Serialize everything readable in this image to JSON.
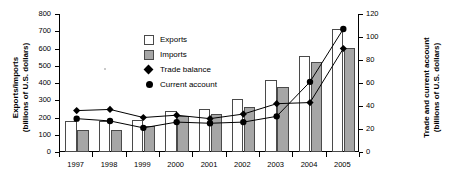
{
  "chart_data": {
    "type": "bar",
    "title": "",
    "categories": [
      "1997",
      "1998",
      "1999",
      "2000",
      "2001",
      "2002",
      "2003",
      "2004",
      "2005"
    ],
    "xlabel": "",
    "ylabel": "Exports/imports (billions of U.S. dollars)",
    "ylabel_right": "Trade and current account (billions of U.S. dollars)",
    "ylim": [
      0,
      800
    ],
    "ylim_right": [
      0,
      120
    ],
    "ytick_values": [
      0,
      100,
      200,
      300,
      400,
      500,
      600,
      700,
      800
    ],
    "ytick_labels": [
      "0",
      "100",
      "200",
      "300",
      "400",
      "500",
      "600",
      "700",
      "800"
    ],
    "ytick_values_right": [
      0,
      20,
      40,
      60,
      80,
      100,
      120
    ],
    "ytick_labels_right": [
      "0",
      "20",
      "40",
      "60",
      "80",
      "100",
      "120"
    ],
    "grid": false,
    "legend_position": "upper-left-inside",
    "series": [
      {
        "name": "Exports",
        "type": "bar",
        "axis": "left",
        "color": "#ffffff",
        "edge_color": "#4a4a4a",
        "values": [
          180,
          178,
          188,
          236,
          247,
          305,
          415,
          555,
          715
        ]
      },
      {
        "name": "Imports",
        "type": "bar",
        "axis": "left",
        "color": "#a6a6a6",
        "edge_color": "#4a4a4a",
        "values": [
          130,
          129,
          150,
          208,
          223,
          261,
          377,
          520,
          605
        ]
      },
      {
        "name": "Trade balance",
        "type": "line",
        "axis": "right",
        "marker": "diamond",
        "color": "#000000",
        "values": [
          36,
          37,
          30,
          32,
          29,
          33,
          42,
          43,
          90
        ]
      },
      {
        "name": "Current account",
        "type": "line",
        "axis": "right",
        "marker": "circle",
        "color": "#000000",
        "values": [
          29,
          27,
          21,
          26,
          25,
          26,
          31,
          61,
          107
        ]
      }
    ]
  },
  "axes": {
    "left_title_line1": "Exports/imports",
    "left_title_line2": "(billions of U.S. dollars)",
    "right_title_line1": "Trade and current account",
    "right_title_line2": "(billions of U.S. dollars)"
  },
  "legend": {
    "items": [
      {
        "label": "Exports",
        "marker": "square-white"
      },
      {
        "label": "Imports",
        "marker": "square-gray"
      },
      {
        "label": "Trade balance",
        "marker": "diamond"
      },
      {
        "label": "Current account",
        "marker": "circle"
      }
    ]
  }
}
